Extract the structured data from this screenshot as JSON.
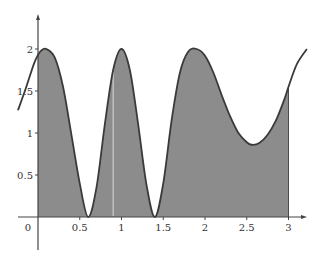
{
  "chart_data": {
    "type": "area",
    "title": "",
    "xlabel": "",
    "ylabel": "",
    "xlim": [
      -0.25,
      3.22
    ],
    "ylim": [
      -0.4,
      2.4
    ],
    "grid": false,
    "legend": null,
    "x_ticks": [
      {
        "value": 0,
        "label": "0"
      },
      {
        "value": 0.5,
        "label": "0.5"
      },
      {
        "value": 1,
        "label": "1"
      },
      {
        "value": 1.5,
        "label": "1.5"
      },
      {
        "value": 2,
        "label": "2"
      },
      {
        "value": 2.5,
        "label": "2.5"
      },
      {
        "value": 3,
        "label": "3"
      }
    ],
    "y_ticks": [
      {
        "value": 0.5,
        "label": "0.5"
      },
      {
        "value": 1,
        "label": "1"
      },
      {
        "value": 1.5,
        "label": "1.5"
      },
      {
        "value": 2,
        "label": "2"
      }
    ],
    "shaded_region": {
      "from_x": 0,
      "to_x": 3,
      "description": "area under curve between x=0 and x=3"
    },
    "curve": {
      "x": [
        -0.24,
        -0.15,
        -0.05,
        0,
        0.05,
        0.1,
        0.2,
        0.3,
        0.4,
        0.5,
        0.6,
        0.7,
        0.8,
        0.9,
        1.0,
        1.1,
        1.2,
        1.3,
        1.4,
        1.5,
        1.6,
        1.7,
        1.8,
        1.9,
        2.0,
        2.1,
        2.2,
        2.3,
        2.4,
        2.5,
        2.56,
        2.65,
        2.75,
        2.85,
        2.95,
        3.0,
        3.1,
        3.22
      ],
      "y": [
        1.27,
        1.52,
        1.82,
        1.93,
        1.99,
        2.0,
        1.9,
        1.55,
        0.98,
        0.4,
        0.0,
        0.35,
        1.1,
        1.75,
        2.0,
        1.75,
        1.1,
        0.38,
        0.0,
        0.4,
        1.15,
        1.72,
        1.97,
        2.0,
        1.92,
        1.72,
        1.45,
        1.2,
        1.0,
        0.89,
        0.86,
        0.88,
        0.98,
        1.15,
        1.4,
        1.55,
        1.82,
        2.0
      ]
    },
    "colors": {
      "fill": "#8c8c8c",
      "line": "#3a3a3a",
      "axis": "#555555",
      "artifact_line": "#d8d8d8"
    },
    "artifact_vertical_line_x": 0.9
  }
}
